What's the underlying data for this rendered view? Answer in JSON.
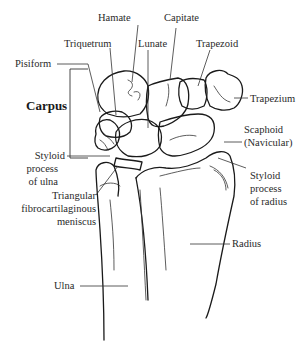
{
  "labels": {
    "hamate": "Hamate",
    "capitate": "Capitate",
    "triquetrum": "Triquetrum",
    "lunate": "Lunate",
    "trapezoid": "Trapezoid",
    "pisiform": "Pisiform",
    "trapezium": "Trapezium",
    "carpus": "Carpus",
    "scaphoid_1": "Scaphoid",
    "scaphoid_2": "(Navicular)",
    "styloid_ulna_1": "Styloid",
    "styloid_ulna_2": "process",
    "styloid_ulna_3": "of ulna",
    "tfcc_1": "Triangular",
    "tfcc_2": "fibrocartilaginous",
    "tfcc_3": "meniscus",
    "styloid_radius_1": "Styloid",
    "styloid_radius_2": "process",
    "styloid_radius_3": "of radius",
    "radius": "Radius",
    "ulna": "Ulna"
  },
  "colors": {
    "line": "#1a1a1a",
    "text": "#2a2a2a",
    "background": "#ffffff"
  }
}
